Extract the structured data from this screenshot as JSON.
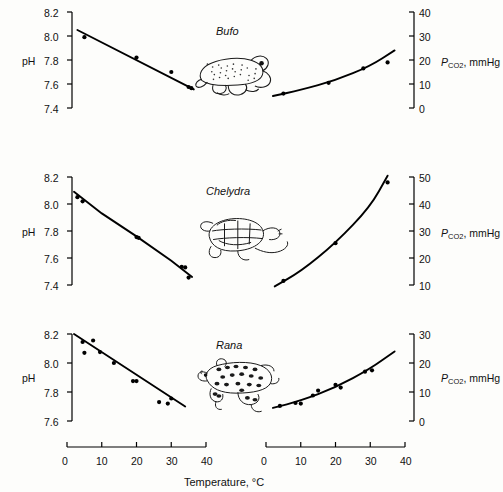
{
  "figure": {
    "xlabel": "Temperature, °C",
    "ph_axis_label": "pH",
    "pco2_axis_label_main": "P",
    "pco2_axis_label_sub": "CO",
    "pco2_axis_label_sub2": "2",
    "pco2_axis_label_unit": ", mmHg",
    "background_color": "#fdfdfb",
    "line_color": "#000000",
    "point_color": "#000000"
  },
  "panels": [
    {
      "species": "Bufo",
      "icon": "toad-illustration",
      "ph_ticks": [
        "8.2",
        "8.0",
        "7.8",
        "7.6",
        "7.4"
      ],
      "pco2_ticks": [
        "40",
        "30",
        "20",
        "10",
        "0"
      ],
      "x_ticks": [
        "0",
        "10",
        "20",
        "30",
        "40"
      ]
    },
    {
      "species": "Chelydra",
      "icon": "turtle-illustration",
      "ph_ticks": [
        "8.2",
        "8.0",
        "7.8",
        "7.6",
        "7.4"
      ],
      "pco2_ticks": [
        "50",
        "40",
        "30",
        "20",
        "10"
      ],
      "x_ticks": [
        "0",
        "10",
        "20",
        "30",
        "40"
      ]
    },
    {
      "species": "Rana",
      "icon": "frog-illustration",
      "ph_ticks": [
        "8.2",
        "8.0",
        "7.8",
        "7.6"
      ],
      "pco2_ticks": [
        "30",
        "20",
        "10",
        "0"
      ],
      "x_ticks": [
        "0",
        "10",
        "20",
        "30",
        "40"
      ]
    }
  ],
  "chart_data": {
    "type": "scatter",
    "title": "",
    "xlabel": "Temperature, °C",
    "panels": [
      {
        "species": "Bufo",
        "left": {
          "ylabel": "pH",
          "ylim": [
            7.4,
            8.2
          ],
          "yticks": [
            7.4,
            7.6,
            7.8,
            8.0,
            8.2
          ],
          "xlim": [
            0,
            40
          ],
          "xticks": [
            0,
            10,
            20,
            30,
            40
          ],
          "points": [
            {
              "x": 5.0,
              "y": 7.99
            },
            {
              "x": 20.0,
              "y": 7.82
            },
            {
              "x": 30.0,
              "y": 7.7
            },
            {
              "x": 35.0,
              "y": 7.575
            },
            {
              "x": 35.8,
              "y": 7.565
            }
          ],
          "fit_line": [
            {
              "x": 3.0,
              "y": 8.05
            },
            {
              "x": 36.5,
              "y": 7.555
            }
          ]
        },
        "right": {
          "ylabel": "PCO2, mmHg",
          "ylim": [
            0,
            40
          ],
          "yticks": [
            0,
            10,
            20,
            30,
            40
          ],
          "xlim": [
            0,
            40
          ],
          "xticks": [
            0,
            10,
            20,
            30,
            40
          ],
          "points": [
            {
              "x": 5.0,
              "y": 6.0
            },
            {
              "x": 18.0,
              "y": 10.5
            },
            {
              "x": 28.0,
              "y": 16.5
            },
            {
              "x": 35.0,
              "y": 19.0
            }
          ],
          "fit_curve": [
            {
              "x": 2.0,
              "y": 5.0
            },
            {
              "x": 10.0,
              "y": 7.5
            },
            {
              "x": 20.0,
              "y": 11.5
            },
            {
              "x": 30.0,
              "y": 17.5
            },
            {
              "x": 37.0,
              "y": 24.0
            }
          ]
        }
      },
      {
        "species": "Chelydra",
        "left": {
          "ylabel": "pH",
          "ylim": [
            7.4,
            8.2
          ],
          "yticks": [
            7.4,
            7.6,
            7.8,
            8.0,
            8.2
          ],
          "xlim": [
            0,
            40
          ],
          "xticks": [
            0,
            10,
            20,
            30,
            40
          ],
          "points": [
            {
              "x": 3.0,
              "y": 8.05
            },
            {
              "x": 4.5,
              "y": 8.02
            },
            {
              "x": 20.0,
              "y": 7.755
            },
            {
              "x": 20.6,
              "y": 7.75
            },
            {
              "x": 33.0,
              "y": 7.535
            },
            {
              "x": 34.0,
              "y": 7.53
            },
            {
              "x": 35.0,
              "y": 7.455
            }
          ],
          "fit_curve": [
            {
              "x": 2.0,
              "y": 8.09
            },
            {
              "x": 10.0,
              "y": 7.93
            },
            {
              "x": 20.0,
              "y": 7.76
            },
            {
              "x": 30.0,
              "y": 7.58
            },
            {
              "x": 36.0,
              "y": 7.46
            }
          ]
        },
        "right": {
          "ylabel": "PCO2, mmHg",
          "ylim": [
            10,
            50
          ],
          "yticks": [
            10,
            20,
            30,
            40,
            50
          ],
          "xlim": [
            0,
            40
          ],
          "xticks": [
            0,
            10,
            20,
            30,
            40
          ],
          "points": [
            {
              "x": 5.0,
              "y": 11.5
            },
            {
              "x": 20.0,
              "y": 25.5
            },
            {
              "x": 35.0,
              "y": 48.0
            }
          ],
          "fit_curve": [
            {
              "x": 2.5,
              "y": 9.5
            },
            {
              "x": 10.0,
              "y": 15.0
            },
            {
              "x": 20.0,
              "y": 25.5
            },
            {
              "x": 30.0,
              "y": 39.0
            },
            {
              "x": 35.0,
              "y": 50.5
            }
          ]
        }
      },
      {
        "species": "Rana",
        "left": {
          "ylabel": "pH",
          "ylim": [
            7.6,
            8.2
          ],
          "yticks": [
            7.6,
            7.8,
            8.0,
            8.2
          ],
          "xlim": [
            0,
            40
          ],
          "xticks": [
            0,
            10,
            20,
            30,
            40
          ],
          "points": [
            {
              "x": 4.5,
              "y": 8.145
            },
            {
              "x": 5.0,
              "y": 8.07
            },
            {
              "x": 7.5,
              "y": 8.155
            },
            {
              "x": 9.5,
              "y": 8.075
            },
            {
              "x": 13.5,
              "y": 8.0
            },
            {
              "x": 19.0,
              "y": 7.875
            },
            {
              "x": 20.0,
              "y": 7.875
            },
            {
              "x": 26.5,
              "y": 7.73
            },
            {
              "x": 29.0,
              "y": 7.72
            },
            {
              "x": 30.0,
              "y": 7.755
            }
          ],
          "fit_line": [
            {
              "x": 2.0,
              "y": 8.2
            },
            {
              "x": 34.0,
              "y": 7.7
            }
          ]
        },
        "right": {
          "ylabel": "PCO2, mmHg",
          "ylim": [
            0,
            30
          ],
          "yticks": [
            0,
            10,
            20,
            30
          ],
          "xlim": [
            0,
            40
          ],
          "xticks": [
            0,
            10,
            20,
            30,
            40
          ],
          "points": [
            {
              "x": 4.0,
              "y": 5.2
            },
            {
              "x": 8.5,
              "y": 6.2
            },
            {
              "x": 10.0,
              "y": 6.0
            },
            {
              "x": 13.5,
              "y": 8.8
            },
            {
              "x": 15.0,
              "y": 10.5
            },
            {
              "x": 20.0,
              "y": 12.5
            },
            {
              "x": 21.5,
              "y": 11.5
            },
            {
              "x": 28.5,
              "y": 17.0
            },
            {
              "x": 30.5,
              "y": 17.5
            }
          ],
          "fit_curve": [
            {
              "x": 2.0,
              "y": 4.5
            },
            {
              "x": 10.0,
              "y": 7.0
            },
            {
              "x": 20.0,
              "y": 11.5
            },
            {
              "x": 30.0,
              "y": 18.0
            },
            {
              "x": 37.0,
              "y": 24.0
            }
          ]
        }
      }
    ]
  }
}
